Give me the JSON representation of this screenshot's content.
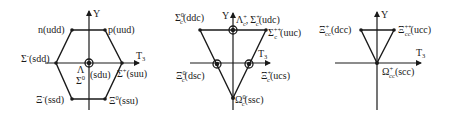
{
  "figure": {
    "colors": {
      "ink": "#1a1a1a",
      "background": "#ffffff"
    },
    "diagrams": [
      {
        "name": "light-baryon-octet",
        "axes": {
          "y_label": "Y",
          "x_label": "T",
          "x_label_sub": "3"
        },
        "states": [
          {
            "id": "n",
            "sym": "n",
            "sub": "",
            "sup": "",
            "quarks": "(udd)"
          },
          {
            "id": "p",
            "sym": "p",
            "sub": "",
            "sup": "",
            "quarks": "(uud)"
          },
          {
            "id": "sigma-minus",
            "sym": "Σ",
            "sub": "",
            "sup": "-",
            "quarks": "(sdd)"
          },
          {
            "id": "sigma-plus",
            "sym": "Σ",
            "sub": "",
            "sup": "+",
            "quarks": "(suu)"
          },
          {
            "id": "lambda",
            "sym": "Λ",
            "sub": "",
            "sup": "",
            "quarks": ""
          },
          {
            "id": "sigma-zero",
            "sym": "Σ",
            "sub": "",
            "sup": "0",
            "quarks": "(sdu)"
          },
          {
            "id": "xi-minus",
            "sym": "Ξ",
            "sub": "",
            "sup": "-",
            "quarks": "(ssd)"
          },
          {
            "id": "xi-zero",
            "sym": "Ξ",
            "sub": "",
            "sup": "0",
            "quarks": "(ssu)"
          }
        ]
      },
      {
        "name": "charmed-baryon-triplet-sextet",
        "axes": {
          "y_label": "Y",
          "x_label": "T",
          "x_label_sub": "3"
        },
        "states": [
          {
            "id": "sigma-c-zero",
            "sym": "Σ",
            "sub": "c",
            "sup": "0",
            "quarks": "(ddc)"
          },
          {
            "id": "lambda-c-plus",
            "sym": "Λ",
            "sub": "c",
            "sup": "+",
            "quarks": ","
          },
          {
            "id": "sigma-c-plus",
            "sym": "Σ",
            "sub": "c",
            "sup": "+",
            "quarks": "(udc)"
          },
          {
            "id": "sigma-c-plusplus",
            "sym": "Σ",
            "sub": "c",
            "sup": "++",
            "quarks": "(uuc)"
          },
          {
            "id": "xi-c-zero",
            "sym": "Ξ",
            "sub": "c",
            "sup": "0",
            "quarks": "(dsc)"
          },
          {
            "id": "xi-c-plus",
            "sym": "Ξ",
            "sub": "c",
            "sup": "+",
            "quarks": "(ucs)"
          },
          {
            "id": "omega-c-zero",
            "sym": "Ω",
            "sub": "c",
            "sup": "0",
            "quarks": "(ssc)"
          }
        ]
      },
      {
        "name": "doubly-charmed-baryon-triplet",
        "axes": {
          "y_label": "Y",
          "x_label": "T",
          "x_label_sub": "3"
        },
        "states": [
          {
            "id": "xi-cc-plus",
            "sym": "Ξ",
            "sub": "cc",
            "sup": "+",
            "quarks": "(dcc)"
          },
          {
            "id": "xi-cc-plusplus",
            "sym": "Ξ",
            "sub": "cc",
            "sup": "++",
            "quarks": "(ucc)"
          },
          {
            "id": "omega-cc-plus",
            "sym": "Ω",
            "sub": "cc",
            "sup": "+",
            "quarks": "(scc)"
          }
        ]
      }
    ]
  }
}
